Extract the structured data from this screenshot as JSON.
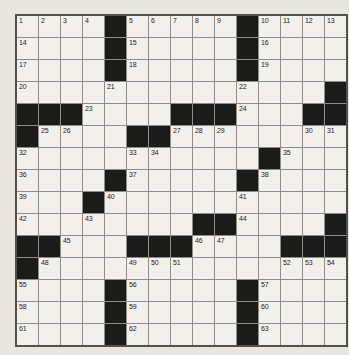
{
  "puzzle": {
    "type": "crossword",
    "rows_count": 15,
    "cols_count": 15,
    "colors": {
      "page_background": "#e9e6e0",
      "cell_background": "#f2f0ea",
      "black_square": "#1b1b19",
      "grid_line": "#8f8d89",
      "outer_border": "#53514c",
      "number_text": "#1c1c1c"
    },
    "rows": [
      "....#.....#....",
      "....#.....#....",
      "....#.....#....",
      "..............#",
      "###....###...##",
      "#....##........",
      "...........#...",
      "....#.....#....",
      "...#...........",
      "........##....#",
      "##...###....###",
      "#..............",
      "....#.....#....",
      "....#.....#....",
      "....#.....#...."
    ],
    "numbers": [
      {
        "n": 1,
        "r": 1,
        "c": 1
      },
      {
        "n": 2,
        "r": 1,
        "c": 2
      },
      {
        "n": 3,
        "r": 1,
        "c": 3
      },
      {
        "n": 4,
        "r": 1,
        "c": 4
      },
      {
        "n": 5,
        "r": 1,
        "c": 6
      },
      {
        "n": 6,
        "r": 1,
        "c": 7
      },
      {
        "n": 7,
        "r": 1,
        "c": 8
      },
      {
        "n": 8,
        "r": 1,
        "c": 9
      },
      {
        "n": 9,
        "r": 1,
        "c": 10
      },
      {
        "n": 10,
        "r": 1,
        "c": 12
      },
      {
        "n": 11,
        "r": 1,
        "c": 13
      },
      {
        "n": 12,
        "r": 1,
        "c": 14
      },
      {
        "n": 13,
        "r": 1,
        "c": 15
      },
      {
        "n": 14,
        "r": 2,
        "c": 1
      },
      {
        "n": 15,
        "r": 2,
        "c": 6
      },
      {
        "n": 16,
        "r": 2,
        "c": 12
      },
      {
        "n": 17,
        "r": 3,
        "c": 1
      },
      {
        "n": 18,
        "r": 3,
        "c": 6
      },
      {
        "n": 19,
        "r": 3,
        "c": 12
      },
      {
        "n": 20,
        "r": 4,
        "c": 1
      },
      {
        "n": 21,
        "r": 4,
        "c": 5
      },
      {
        "n": 22,
        "r": 4,
        "c": 11
      },
      {
        "n": 23,
        "r": 5,
        "c": 4
      },
      {
        "n": 24,
        "r": 5,
        "c": 11
      },
      {
        "n": 25,
        "r": 6,
        "c": 2
      },
      {
        "n": 26,
        "r": 6,
        "c": 3
      },
      {
        "n": 27,
        "r": 6,
        "c": 8
      },
      {
        "n": 28,
        "r": 6,
        "c": 9
      },
      {
        "n": 29,
        "r": 6,
        "c": 10
      },
      {
        "n": 30,
        "r": 6,
        "c": 14
      },
      {
        "n": 31,
        "r": 6,
        "c": 15
      },
      {
        "n": 32,
        "r": 7,
        "c": 1
      },
      {
        "n": 33,
        "r": 7,
        "c": 6
      },
      {
        "n": 34,
        "r": 7,
        "c": 7
      },
      {
        "n": 35,
        "r": 7,
        "c": 13
      },
      {
        "n": 36,
        "r": 8,
        "c": 1
      },
      {
        "n": 37,
        "r": 8,
        "c": 6
      },
      {
        "n": 38,
        "r": 8,
        "c": 12
      },
      {
        "n": 39,
        "r": 9,
        "c": 1
      },
      {
        "n": 40,
        "r": 9,
        "c": 5
      },
      {
        "n": 41,
        "r": 9,
        "c": 11
      },
      {
        "n": 42,
        "r": 10,
        "c": 1
      },
      {
        "n": 43,
        "r": 10,
        "c": 4
      },
      {
        "n": 44,
        "r": 10,
        "c": 11
      },
      {
        "n": 45,
        "r": 11,
        "c": 3
      },
      {
        "n": 46,
        "r": 11,
        "c": 9
      },
      {
        "n": 47,
        "r": 11,
        "c": 10
      },
      {
        "n": 48,
        "r": 12,
        "c": 2
      },
      {
        "n": 49,
        "r": 12,
        "c": 6
      },
      {
        "n": 50,
        "r": 12,
        "c": 7
      },
      {
        "n": 51,
        "r": 12,
        "c": 8
      },
      {
        "n": 52,
        "r": 12,
        "c": 13
      },
      {
        "n": 53,
        "r": 12,
        "c": 14
      },
      {
        "n": 54,
        "r": 12,
        "c": 15
      },
      {
        "n": 55,
        "r": 13,
        "c": 1
      },
      {
        "n": 56,
        "r": 13,
        "c": 6
      },
      {
        "n": 57,
        "r": 13,
        "c": 12
      },
      {
        "n": 58,
        "r": 14,
        "c": 1
      },
      {
        "n": 59,
        "r": 14,
        "c": 6
      },
      {
        "n": 60,
        "r": 14,
        "c": 12
      },
      {
        "n": 61,
        "r": 15,
        "c": 1
      },
      {
        "n": 62,
        "r": 15,
        "c": 6
      },
      {
        "n": 63,
        "r": 15,
        "c": 12
      }
    ]
  }
}
